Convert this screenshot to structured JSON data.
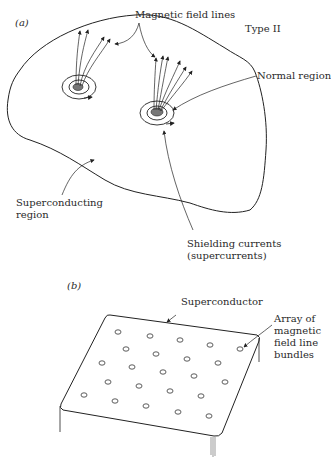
{
  "figure": {
    "panel_a": {
      "label": "(a)",
      "type_label": "Type II",
      "annotations": {
        "field_lines": "Magnetic field lines",
        "normal_region": "Normal region",
        "superconducting_line1": "Superconducting",
        "superconducting_line2": "region",
        "shielding_line1": "Shielding currents",
        "shielding_line2": "(supercurrents)"
      }
    },
    "panel_b": {
      "label": "(b)",
      "annotations": {
        "superconductor": "Superconductor",
        "array_line1": "Array of",
        "array_line2": "magnetic",
        "array_line3": "field line",
        "array_line4": "bundles"
      },
      "bundle_count": 23
    }
  }
}
